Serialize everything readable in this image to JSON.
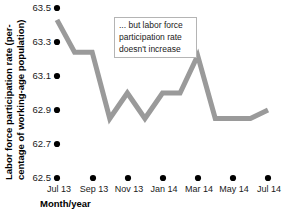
{
  "chart_data": {
    "type": "line",
    "title": "",
    "subtitle": "",
    "xlabel": "Month/year",
    "ylabel": "Labor force participation rate (percentage of working-age population)",
    "ylabel_line1": "Labor force participation rate (per-",
    "ylabel_line2": "centage of working-age population)",
    "ylim": [
      62.5,
      63.5
    ],
    "ytick_values": [
      62.5,
      62.7,
      62.9,
      63.1,
      63.3,
      63.5
    ],
    "ytick_labels": [
      "62.5",
      "62.7",
      "62.9",
      "63.1",
      "63.3",
      "63.5"
    ],
    "grid": false,
    "legend": "none",
    "x": [
      "Jul 13",
      "Aug 13",
      "Sep 13",
      "Oct 13",
      "Nov 13",
      "Dec 13",
      "Jan 14",
      "Feb 14",
      "Mar 14",
      "Apr 14",
      "May 14",
      "Jun 14",
      "Jul 14"
    ],
    "xtick_labels": [
      "Jul 13",
      "Sep 13",
      "Nov 13",
      "Jan 14",
      "Mar 14",
      "May 14",
      "Jul 14"
    ],
    "xtick_indices": [
      0,
      2,
      4,
      6,
      8,
      10,
      12
    ],
    "values": [
      63.43,
      63.24,
      63.24,
      62.85,
      63.0,
      62.85,
      63.0,
      63.0,
      63.22,
      62.85,
      62.85,
      62.85,
      62.9
    ],
    "series_name": "Labor force participation rate",
    "line_color": "#9a9a9a",
    "line_width": 5,
    "tick_dot_color": "#000000"
  },
  "annotation": {
    "line1": "... but labor force",
    "line2": "participation rate",
    "line3": "doesn't increase",
    "border_color": "#b4b4b4",
    "background": "#ffffff"
  }
}
